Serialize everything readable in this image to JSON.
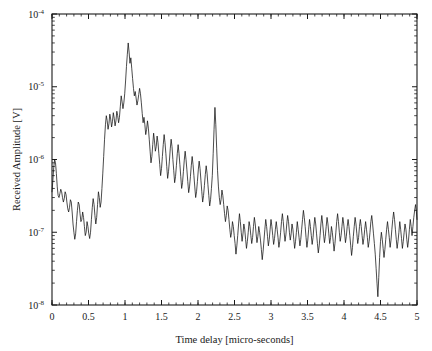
{
  "chart_data": {
    "type": "line",
    "title": "",
    "xlabel": "Time delay [micro-seconds]",
    "ylabel": "Received Amplitude [V]",
    "xlim": [
      0,
      5
    ],
    "ylim": [
      1e-08,
      0.0001
    ],
    "yscale": "log",
    "xscale": "linear",
    "grid": false,
    "legend": null,
    "xticks": [
      0,
      0.5,
      1,
      1.5,
      2,
      2.5,
      3,
      3.5,
      4,
      4.5,
      5
    ],
    "xticklabels": [
      "0",
      "0.5",
      "1",
      "1.5",
      "2",
      "2.5",
      "3",
      "3.5",
      "4",
      "4.5",
      "5"
    ],
    "yticks": [
      1e-08,
      1e-07,
      1e-06,
      1e-05,
      0.0001
    ],
    "yticklabels": [
      "10-8",
      "10-7",
      "10-6",
      "10-5",
      "10-4"
    ],
    "ytick_mantissa": "10",
    "ytick_exponents": [
      "-8",
      "-7",
      "-6",
      "-5",
      "-4"
    ],
    "series": [
      {
        "name": "received amplitude",
        "color": "#101010",
        "x": [
          0.0,
          0.012,
          0.024,
          0.036,
          0.048,
          0.06,
          0.072,
          0.084,
          0.096,
          0.108,
          0.12,
          0.132,
          0.144,
          0.156,
          0.168,
          0.18,
          0.192,
          0.204,
          0.216,
          0.228,
          0.24,
          0.252,
          0.264,
          0.276,
          0.288,
          0.3,
          0.312,
          0.324,
          0.336,
          0.348,
          0.36,
          0.372,
          0.384,
          0.396,
          0.408,
          0.42,
          0.432,
          0.444,
          0.456,
          0.468,
          0.48,
          0.492,
          0.504,
          0.516,
          0.528,
          0.54,
          0.552,
          0.564,
          0.576,
          0.588,
          0.6,
          0.612,
          0.624,
          0.636,
          0.648,
          0.66,
          0.672,
          0.684,
          0.696,
          0.708,
          0.72,
          0.732,
          0.744,
          0.756,
          0.768,
          0.78,
          0.792,
          0.804,
          0.816,
          0.828,
          0.84,
          0.852,
          0.864,
          0.876,
          0.888,
          0.9,
          0.912,
          0.924,
          0.936,
          0.948,
          0.96,
          0.972,
          0.984,
          0.996,
          1.008,
          1.02,
          1.032,
          1.044,
          1.056,
          1.068,
          1.08,
          1.092,
          1.104,
          1.116,
          1.128,
          1.14,
          1.152,
          1.164,
          1.176,
          1.188,
          1.2,
          1.212,
          1.224,
          1.236,
          1.248,
          1.26,
          1.272,
          1.284,
          1.296,
          1.308,
          1.32,
          1.332,
          1.344,
          1.356,
          1.368,
          1.38,
          1.392,
          1.404,
          1.416,
          1.428,
          1.44,
          1.452,
          1.464,
          1.476,
          1.488,
          1.5,
          1.512,
          1.524,
          1.536,
          1.548,
          1.56,
          1.572,
          1.584,
          1.596,
          1.608,
          1.62,
          1.632,
          1.644,
          1.656,
          1.668,
          1.68,
          1.692,
          1.704,
          1.716,
          1.728,
          1.74,
          1.752,
          1.764,
          1.776,
          1.788,
          1.8,
          1.812,
          1.824,
          1.836,
          1.848,
          1.86,
          1.872,
          1.884,
          1.896,
          1.908,
          1.92,
          1.932,
          1.944,
          1.956,
          1.968,
          1.98,
          1.992,
          2.004,
          2.016,
          2.028,
          2.04,
          2.052,
          2.064,
          2.076,
          2.088,
          2.1,
          2.112,
          2.124,
          2.136,
          2.148,
          2.16,
          2.172,
          2.184,
          2.196,
          2.208,
          2.22,
          2.232,
          2.244,
          2.256,
          2.268,
          2.28,
          2.292,
          2.304,
          2.316,
          2.328,
          2.34,
          2.352,
          2.364,
          2.376,
          2.388,
          2.4,
          2.412,
          2.424,
          2.436,
          2.448,
          2.46,
          2.472,
          2.484,
          2.496,
          2.508,
          2.52,
          2.532,
          2.544,
          2.556,
          2.568,
          2.58,
          2.592,
          2.604,
          2.616,
          2.628,
          2.64,
          2.652,
          2.664,
          2.676,
          2.688,
          2.7,
          2.712,
          2.724,
          2.736,
          2.748,
          2.76,
          2.772,
          2.784,
          2.796,
          2.808,
          2.82,
          2.832,
          2.844,
          2.856,
          2.868,
          2.88,
          2.892,
          2.904,
          2.916,
          2.928,
          2.94,
          2.952,
          2.964,
          2.976,
          2.988,
          3.0,
          3.012,
          3.024,
          3.036,
          3.048,
          3.06,
          3.072,
          3.084,
          3.096,
          3.108,
          3.12,
          3.132,
          3.144,
          3.156,
          3.168,
          3.18,
          3.192,
          3.204,
          3.216,
          3.228,
          3.24,
          3.252,
          3.264,
          3.276,
          3.288,
          3.3,
          3.312,
          3.324,
          3.336,
          3.348,
          3.36,
          3.372,
          3.384,
          3.396,
          3.408,
          3.42,
          3.432,
          3.444,
          3.456,
          3.468,
          3.48,
          3.492,
          3.504,
          3.516,
          3.528,
          3.54,
          3.552,
          3.564,
          3.576,
          3.588,
          3.6,
          3.612,
          3.624,
          3.636,
          3.648,
          3.66,
          3.672,
          3.684,
          3.696,
          3.708,
          3.72,
          3.732,
          3.744,
          3.756,
          3.768,
          3.78,
          3.792,
          3.804,
          3.816,
          3.828,
          3.84,
          3.852,
          3.864,
          3.876,
          3.888,
          3.9,
          3.912,
          3.924,
          3.936,
          3.948,
          3.96,
          3.972,
          3.984,
          3.996,
          4.008,
          4.02,
          4.032,
          4.044,
          4.056,
          4.068,
          4.08,
          4.092,
          4.104,
          4.116,
          4.128,
          4.14,
          4.152,
          4.164,
          4.176,
          4.188,
          4.2,
          4.212,
          4.224,
          4.236,
          4.248,
          4.26,
          4.272,
          4.284,
          4.296,
          4.308,
          4.32,
          4.332,
          4.344,
          4.356,
          4.368,
          4.38,
          4.392,
          4.404,
          4.416,
          4.428,
          4.44,
          4.452,
          4.464,
          4.476,
          4.488,
          4.5,
          4.512,
          4.524,
          4.536,
          4.548,
          4.56,
          4.572,
          4.584,
          4.596,
          4.608,
          4.62,
          4.632,
          4.644,
          4.656,
          4.668,
          4.68,
          4.692,
          4.704,
          4.716,
          4.728,
          4.74,
          4.752,
          4.764,
          4.776,
          4.788,
          4.8,
          4.812,
          4.824,
          4.836,
          4.848,
          4.86,
          4.872,
          4.884,
          4.896,
          4.908,
          4.92,
          4.932,
          4.944,
          4.956,
          4.968,
          4.98,
          4.992,
          5.0
        ],
        "y": [
          3.6e-07,
          5.2e-07,
          7.8e-07,
          1e-06,
          9e-07,
          6.4e-07,
          4.2e-07,
          3.2e-07,
          3e-07,
          3.4e-07,
          3.9e-07,
          3.6e-07,
          3e-07,
          2.6e-07,
          2.9e-07,
          3.6e-07,
          3.3e-07,
          2.6e-07,
          2.1e-07,
          1.9e-07,
          2.2e-07,
          2.8e-07,
          2.6e-07,
          1.9e-07,
          1.3e-07,
          1e-07,
          8e-08,
          9.5e-08,
          1.4e-07,
          2e-07,
          2.6e-07,
          2.4e-07,
          1.8e-07,
          1.4e-07,
          1.5e-07,
          1.9e-07,
          1.6e-07,
          1.2e-07,
          9e-08,
          1e-07,
          1.4e-07,
          1.2e-07,
          9.5e-08,
          8.2e-08,
          1e-07,
          1.5e-07,
          2.2e-07,
          2.9e-07,
          2.4e-07,
          1.7e-07,
          1.3e-07,
          1.6e-07,
          2.4e-07,
          3.6e-07,
          3e-07,
          2.2e-07,
          2.6e-07,
          4e-07,
          6.5e-07,
          1.1e-06,
          1.9e-06,
          3e-06,
          4e-06,
          3.4e-06,
          2.6e-06,
          3.1e-06,
          4.2e-06,
          3.6e-06,
          2.8e-06,
          3.3e-06,
          4.4e-06,
          3.7e-06,
          2.9e-06,
          3.4e-06,
          4.6e-06,
          4e-06,
          3.2e-06,
          3.8e-06,
          5.4e-06,
          7.5e-06,
          6.2e-06,
          5e-06,
          6e-06,
          8e-06,
          1.2e-05,
          1.9e-05,
          2.8e-05,
          4e-05,
          3e-05,
          2.1e-05,
          2.5e-05,
          1.8e-05,
          1.3e-05,
          9.5e-06,
          7.5e-06,
          8.6e-06,
          7e-06,
          5.6e-06,
          6.4e-06,
          7.8e-06,
          9.5e-06,
          8e-06,
          6e-06,
          4.3e-06,
          3.2e-06,
          3.8e-06,
          3e-06,
          2.2e-06,
          2.6e-06,
          3.4e-06,
          2.7e-06,
          1.9e-06,
          1.3e-06,
          9e-07,
          1.1e-06,
          1.6e-06,
          2.3e-06,
          1.8e-06,
          1.3e-06,
          1.5e-06,
          2.1e-06,
          1.7e-06,
          1.2e-06,
          8.5e-07,
          6e-07,
          7.5e-07,
          1.1e-06,
          1.6e-06,
          2.2e-06,
          1.7e-06,
          1.2e-06,
          8e-07,
          5.5e-07,
          6.8e-07,
          9.5e-07,
          1.4e-06,
          1.9e-06,
          1.5e-06,
          1e-06,
          7e-07,
          4.8e-07,
          5.8e-07,
          8.2e-07,
          1.2e-06,
          1.6e-06,
          1.2e-06,
          8.5e-07,
          5.8e-07,
          4e-07,
          4.8e-07,
          6.8e-07,
          9.8e-07,
          1.3e-06,
          1e-06,
          7.2e-07,
          5e-07,
          3.5e-07,
          4.2e-07,
          5.8e-07,
          8.2e-07,
          1.1e-06,
          8.5e-07,
          6e-07,
          4.2e-07,
          3e-07,
          3.6e-07,
          5e-07,
          7.2e-07,
          9.5e-07,
          7.5e-07,
          5.2e-07,
          3.6e-07,
          2.6e-07,
          3.2e-07,
          4.4e-07,
          6.2e-07,
          8.2e-07,
          6.5e-07,
          4.5e-07,
          3.2e-07,
          2.3e-07,
          2.8e-07,
          4e-07,
          6e-07,
          1.2e-06,
          2.6e-06,
          5.2e-06,
          3e-06,
          1.4e-06,
          7e-07,
          4.2e-07,
          3e-07,
          2.4e-07,
          2.8e-07,
          3.8e-07,
          3.2e-07,
          2.4e-07,
          1.8e-07,
          1.4e-07,
          1.7e-07,
          2.3e-07,
          2e-07,
          1.5e-07,
          1.1e-07,
          8.5e-08,
          1e-07,
          1.4e-07,
          1.2e-07,
          9e-08,
          7e-08,
          5e-08,
          6.5e-08,
          9e-08,
          1.3e-07,
          1.8e-07,
          1.4e-07,
          1e-07,
          7.5e-08,
          9.5e-08,
          1.3e-07,
          1.1e-07,
          8e-08,
          6e-08,
          7.5e-08,
          1e-07,
          1.4e-07,
          1.2e-07,
          9e-08,
          7e-08,
          8.5e-08,
          1.2e-07,
          1.6e-07,
          1.3e-07,
          9.5e-08,
          7.2e-08,
          8.8e-08,
          1.2e-07,
          1e-07,
          7.8e-08,
          5.8e-08,
          4.2e-08,
          5.5e-08,
          7.8e-08,
          1.1e-07,
          1.5e-07,
          1.2e-07,
          8.8e-08,
          6.5e-08,
          8e-08,
          1.1e-07,
          1.5e-07,
          1.2e-07,
          9e-08,
          6.8e-08,
          8.2e-08,
          1.1e-07,
          1.4e-07,
          1.1e-07,
          8.5e-08,
          6.2e-08,
          7.5e-08,
          1e-07,
          1.4e-07,
          1.8e-07,
          1.4e-07,
          1e-07,
          7.5e-08,
          9.2e-08,
          1.3e-07,
          1.7e-07,
          1.4e-07,
          1e-07,
          7.8e-08,
          9.5e-08,
          1.3e-07,
          1.1e-07,
          8e-08,
          6e-08,
          7.5e-08,
          1e-07,
          1.4e-07,
          1.1e-07,
          8.5e-08,
          6.5e-08,
          8e-08,
          1.1e-07,
          1.5e-07,
          2e-07,
          1.6e-07,
          1.2e-07,
          8.5e-08,
          6.2e-08,
          7.8e-08,
          1.1e-07,
          1.5e-07,
          1.2e-07,
          9e-08,
          6.8e-08,
          8.5e-08,
          1.2e-07,
          1.6e-07,
          1.3e-07,
          9.5e-08,
          7e-08,
          5.2e-08,
          6.5e-08,
          9e-08,
          1.3e-07,
          1.7e-07,
          1.3e-07,
          9.5e-08,
          7.2e-08,
          8.8e-08,
          1.2e-07,
          1.6e-07,
          1.3e-07,
          9.5e-08,
          7e-08,
          8.5e-08,
          1.2e-07,
          1e-07,
          7.5e-08,
          5.5e-08,
          7e-08,
          9.8e-08,
          1.4e-07,
          1.8e-07,
          1.4e-07,
          1e-07,
          7.5e-08,
          9e-08,
          1.2e-07,
          1.6e-07,
          1.3e-07,
          9.8e-08,
          7.2e-08,
          8.8e-08,
          1.2e-07,
          1.5e-07,
          1.2e-07,
          9e-08,
          6.5e-08,
          4.8e-08,
          6.2e-08,
          8.8e-08,
          1.2e-07,
          1.6e-07,
          1.3e-07,
          9.5e-08,
          7e-08,
          8.5e-08,
          1.2e-07,
          1.5e-07,
          1.2e-07,
          9e-08,
          6.8e-08,
          8.2e-08,
          1.1e-07,
          1.4e-07,
          1.1e-07,
          8.5e-08,
          6.2e-08,
          7.5e-08,
          1e-07,
          1.4e-07,
          1.7e-07,
          1.3e-07,
          9.5e-08,
          7e-08,
          5e-08,
          3.2e-08,
          2e-08,
          1.3e-08,
          2.4e-08,
          4.5e-08,
          7.5e-08,
          1e-07,
          8e-08,
          6e-08,
          4.5e-08,
          5.8e-08,
          8e-08,
          1.1e-07,
          1.4e-07,
          1.1e-07,
          8.5e-08,
          6.2e-08,
          7.8e-08,
          1.1e-07,
          1.5e-07,
          1.9e-07,
          1.5e-07,
          1.1e-07,
          8e-08,
          6e-08,
          7.5e-08,
          1e-07,
          1.4e-07,
          1.1e-07,
          8.2e-08,
          6e-08,
          7.5e-08,
          1e-07,
          1.3e-07,
          1.1e-07,
          8e-08,
          6.2e-08,
          7.8e-08,
          1.1e-07,
          1.5e-07,
          1.2e-07,
          9e-08,
          1.2e-07,
          1.6e-07,
          2e-07,
          2.4e-07,
          1.9e-07,
          1.5e-07
        ]
      }
    ]
  },
  "figure": {
    "background": "#ffffff",
    "axis_color": "#1a1a1a",
    "trace_color": "#101010"
  }
}
